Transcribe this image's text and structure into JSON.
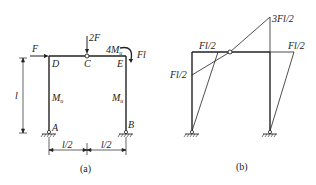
{
  "figure_a": {
    "caption": "(a)",
    "labels": {
      "F": "F",
      "twoF": "2F",
      "D": "D",
      "C": "C",
      "E": "E",
      "fourM": "4M",
      "fourM_sub": "u",
      "Fl": "Fl",
      "l": "l",
      "M_left": "M",
      "M_left_sub": "u",
      "M_right": "M",
      "M_right_sub": "u",
      "A": "A",
      "B": "B",
      "half_left": "l/2",
      "half_right": "l/2"
    }
  },
  "figure_b": {
    "caption": "(b)",
    "labels": {
      "peak": "3Fl/2",
      "beam_left": "Fl/2",
      "beam_right": "Fl/2",
      "column_left": "Fl/2"
    }
  }
}
